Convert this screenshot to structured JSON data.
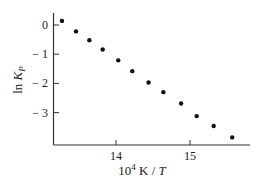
{
  "chart_data": {
    "type": "scatter",
    "title": "",
    "xlabel": "10^4 K / T",
    "xlabel_parts": {
      "base": "10",
      "sup": "4",
      "rest": " K / ",
      "italic": "T"
    },
    "ylabel": "ln K_P",
    "ylabel_parts": {
      "pre": "ln ",
      "italic": "K",
      "sub": "P"
    },
    "xlim": [
      13.15,
      15.8
    ],
    "ylim": [
      -4.15,
      0.4
    ],
    "x_ticks": [
      14,
      15
    ],
    "x_tick_labels": [
      "14",
      "15"
    ],
    "y_ticks": [
      0,
      -1,
      -2,
      -3
    ],
    "y_tick_labels": [
      "0",
      "− 1",
      "− 2",
      "− 3"
    ],
    "grid": false,
    "legend": null,
    "series": [
      {
        "name": "ln Kp",
        "marker": "circle",
        "color": "#111111",
        "x": [
          13.27,
          13.46,
          13.64,
          13.82,
          14.03,
          14.22,
          14.44,
          14.64,
          14.88,
          15.09,
          15.32,
          15.57
        ],
        "y": [
          0.14,
          -0.22,
          -0.52,
          -0.84,
          -1.21,
          -1.58,
          -1.97,
          -2.3,
          -2.69,
          -3.12,
          -3.46,
          -3.85
        ]
      }
    ]
  }
}
